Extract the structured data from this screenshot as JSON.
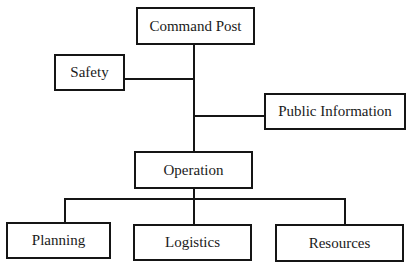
{
  "diagram": {
    "type": "org-chart",
    "nodes": {
      "command_post": "Command Post",
      "safety": "Safety",
      "public_information": "Public Information",
      "operation": "Operation",
      "planning": "Planning",
      "logistics": "Logistics",
      "resources": "Resources"
    },
    "edges": [
      {
        "from": "Command Post",
        "to": "Safety"
      },
      {
        "from": "Command Post",
        "to": "Public Information"
      },
      {
        "from": "Command Post",
        "to": "Operation"
      },
      {
        "from": "Operation",
        "to": "Planning"
      },
      {
        "from": "Operation",
        "to": "Logistics"
      },
      {
        "from": "Operation",
        "to": "Resources"
      }
    ],
    "colors": {
      "line": "#151515",
      "background": "#ffffff"
    }
  }
}
